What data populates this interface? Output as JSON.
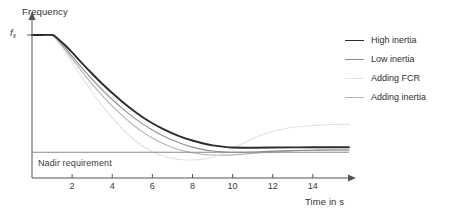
{
  "chart_data": {
    "type": "line",
    "title": "",
    "xlabel": "Time in s",
    "ylabel": "Frequency",
    "xlim": [
      0,
      15.8
    ],
    "ylim": [
      0,
      1.06
    ],
    "grid": false,
    "legend_position": "right",
    "x_ticks": [
      "2",
      "4",
      "6",
      "8",
      "10",
      "12",
      "14"
    ],
    "x_tick_values": [
      2,
      4,
      6,
      8,
      10,
      12,
      14
    ],
    "y_ticks": [
      "f",
      "x"
    ],
    "y_axis_value_label": "f",
    "y_axis_value_subscript": "x",
    "y_axis_value_level": 1.0,
    "annotations": [
      {
        "name": "nadir-requirement",
        "label": "Nadir requirement",
        "type": "horizontal-line",
        "y_value": 0.18,
        "x_start": 0,
        "x_end": 15.8,
        "color": "#8a8a8a"
      }
    ],
    "series": [
      {
        "name": "High inertia",
        "color": "#2b2b2b",
        "width": 1.9,
        "nadir_time": 9.0,
        "nadir_value": 0.205,
        "steady_state": 0.215,
        "x": [
          0,
          0.5,
          1.0,
          1.2,
          1.6,
          2.0,
          2.5,
          3.0,
          3.5,
          4.0,
          4.5,
          5.0,
          5.5,
          6.0,
          6.5,
          7.0,
          7.5,
          8.0,
          8.5,
          9.0,
          9.5,
          10.0,
          11.0,
          12.0,
          13.0,
          14.0,
          15.0,
          15.8
        ],
        "y": [
          1.0,
          1.0,
          1.0,
          0.985,
          0.935,
          0.878,
          0.802,
          0.729,
          0.659,
          0.594,
          0.533,
          0.477,
          0.427,
          0.383,
          0.345,
          0.312,
          0.284,
          0.262,
          0.243,
          0.228,
          0.219,
          0.213,
          0.212,
          0.213,
          0.214,
          0.215,
          0.215,
          0.215
        ]
      },
      {
        "name": "Low inertia",
        "color": "#8e8e8e",
        "width": 1.1,
        "nadir_time": 7.6,
        "nadir_value": 0.178,
        "steady_state": 0.196,
        "x": [
          0,
          0.5,
          1.0,
          1.2,
          1.6,
          2.0,
          2.5,
          3.0,
          3.5,
          4.0,
          4.5,
          5.0,
          5.5,
          6.0,
          6.5,
          7.0,
          7.5,
          8.0,
          8.5,
          9.0,
          9.5,
          10.0,
          11.0,
          12.0,
          13.0,
          14.0,
          15.0,
          15.8
        ],
        "y": [
          1.0,
          1.0,
          1.0,
          0.978,
          0.918,
          0.852,
          0.768,
          0.69,
          0.617,
          0.549,
          0.487,
          0.431,
          0.38,
          0.336,
          0.298,
          0.265,
          0.238,
          0.216,
          0.2,
          0.189,
          0.183,
          0.18,
          0.182,
          0.188,
          0.192,
          0.194,
          0.196,
          0.196
        ]
      },
      {
        "name": "Adding FCR",
        "color": "#e2e2e2",
        "width": 1.1,
        "nadir_time": 5.0,
        "nadir_value": 0.105,
        "steady_state": 0.375,
        "x": [
          0,
          0.5,
          1.0,
          1.2,
          1.6,
          2.0,
          2.5,
          3.0,
          3.5,
          4.0,
          4.5,
          5.0,
          5.5,
          6.0,
          6.5,
          7.0,
          7.5,
          8.0,
          8.5,
          9.0,
          9.5,
          10.0,
          11.0,
          12.0,
          13.0,
          14.0,
          15.0,
          15.8
        ],
        "y": [
          1.0,
          1.0,
          1.0,
          0.97,
          0.892,
          0.806,
          0.7,
          0.6,
          0.505,
          0.42,
          0.344,
          0.278,
          0.225,
          0.184,
          0.155,
          0.137,
          0.128,
          0.126,
          0.132,
          0.147,
          0.172,
          0.205,
          0.275,
          0.327,
          0.355,
          0.368,
          0.374,
          0.375
        ]
      },
      {
        "name": "Adding inertia",
        "color": "#b4b4b4",
        "width": 1.1,
        "nadir_time": 6.3,
        "nadir_value": 0.148,
        "steady_state": 0.196,
        "x": [
          0,
          0.5,
          1.0,
          1.2,
          1.6,
          2.0,
          2.5,
          3.0,
          3.5,
          4.0,
          4.5,
          5.0,
          5.5,
          6.0,
          6.5,
          7.0,
          7.5,
          8.0,
          8.5,
          9.0,
          9.5,
          10.0,
          11.0,
          12.0,
          13.0,
          14.0,
          15.0,
          15.8
        ],
        "y": [
          1.0,
          1.0,
          1.0,
          0.975,
          0.906,
          0.833,
          0.742,
          0.656,
          0.576,
          0.502,
          0.436,
          0.376,
          0.324,
          0.28,
          0.243,
          0.214,
          0.192,
          0.176,
          0.166,
          0.161,
          0.16,
          0.162,
          0.172,
          0.183,
          0.19,
          0.194,
          0.196,
          0.196
        ]
      }
    ]
  },
  "legend": {
    "items": [
      {
        "label": "High inertia",
        "color": "#2b2b2b",
        "width": 1.9
      },
      {
        "label": "Low inertia",
        "color": "#8e8e8e",
        "width": 1.1
      },
      {
        "label": "Adding FCR",
        "color": "#e2e2e2",
        "width": 1.1
      },
      {
        "label": "Adding inertia",
        "color": "#b4b4b4",
        "width": 1.1
      }
    ]
  },
  "axes": {
    "y_title": "Frequency",
    "x_title": "Time in s"
  }
}
